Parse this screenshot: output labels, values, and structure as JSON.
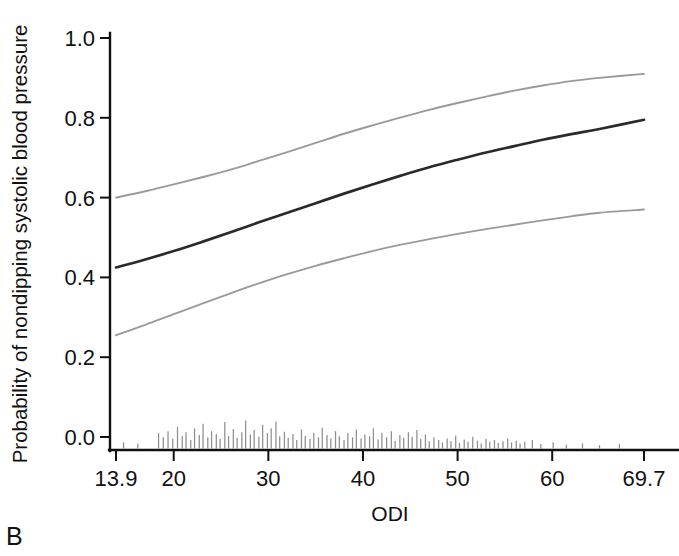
{
  "panel": {
    "letter": "B"
  },
  "chart_data": {
    "type": "line",
    "title": "",
    "subtitle": "",
    "xlabel": "ODI",
    "ylabel": "Probability of nondipping systolic blood pressure",
    "xlim": [
      13.9,
      69.7
    ],
    "ylim": [
      0.0,
      1.0
    ],
    "grid": false,
    "legend": "none",
    "xticks": [
      13.9,
      20,
      30,
      40,
      50,
      60,
      69.7
    ],
    "xtick_labels": [
      "13.9",
      "20",
      "30",
      "40",
      "50",
      "60",
      "69.7"
    ],
    "yticks": [
      0.0,
      0.2,
      0.4,
      0.6,
      0.8,
      1.0
    ],
    "ytick_labels": [
      "0.0",
      "0.2",
      "0.4",
      "0.6",
      "0.8",
      "1.0"
    ],
    "x": [
      13.9,
      17,
      20,
      23,
      26,
      29,
      32,
      35,
      38,
      41,
      44,
      47,
      50,
      53,
      56,
      59,
      62,
      65,
      69.7
    ],
    "series": [
      {
        "name": "upper-95-confidence-limit",
        "color": "#9a9a9a",
        "style": "solid",
        "values": [
          0.6,
          0.616,
          0.633,
          0.651,
          0.67,
          0.692,
          0.714,
          0.737,
          0.76,
          0.781,
          0.801,
          0.82,
          0.837,
          0.853,
          0.868,
          0.881,
          0.892,
          0.9,
          0.91
        ]
      },
      {
        "name": "predicted-probability",
        "color": "#2a2a2a",
        "style": "solid",
        "values": [
          0.425,
          0.445,
          0.466,
          0.489,
          0.513,
          0.538,
          0.562,
          0.586,
          0.61,
          0.633,
          0.655,
          0.676,
          0.695,
          0.713,
          0.729,
          0.745,
          0.759,
          0.772,
          0.795
        ]
      },
      {
        "name": "lower-95-confidence-limit",
        "color": "#9a9a9a",
        "style": "solid",
        "values": [
          0.255,
          0.281,
          0.308,
          0.334,
          0.36,
          0.385,
          0.408,
          0.429,
          0.448,
          0.466,
          0.482,
          0.496,
          0.509,
          0.521,
          0.532,
          0.543,
          0.553,
          0.562,
          0.57
        ]
      }
    ],
    "rug": {
      "name": "observation-density-rug",
      "color": "#8e8e8e",
      "description": "vertical tick marks above x-axis indicating ODI observation density",
      "marks": [
        [
          14.7,
          0.22
        ],
        [
          16.2,
          0.18
        ],
        [
          18.4,
          0.55
        ],
        [
          18.9,
          0.4
        ],
        [
          19.4,
          0.62
        ],
        [
          19.9,
          0.35
        ],
        [
          20.4,
          0.78
        ],
        [
          20.9,
          0.45
        ],
        [
          21.3,
          0.58
        ],
        [
          21.8,
          0.3
        ],
        [
          22.2,
          0.72
        ],
        [
          22.7,
          0.48
        ],
        [
          23.1,
          0.88
        ],
        [
          23.6,
          0.4
        ],
        [
          24.0,
          0.62
        ],
        [
          24.5,
          0.52
        ],
        [
          24.9,
          0.35
        ],
        [
          25.4,
          0.95
        ],
        [
          25.8,
          0.45
        ],
        [
          26.3,
          0.7
        ],
        [
          26.7,
          0.38
        ],
        [
          27.2,
          0.58
        ],
        [
          27.6,
          1.0
        ],
        [
          28.1,
          0.5
        ],
        [
          28.5,
          0.66
        ],
        [
          29.0,
          0.42
        ],
        [
          29.4,
          0.85
        ],
        [
          29.9,
          0.55
        ],
        [
          30.3,
          0.72
        ],
        [
          30.8,
          0.96
        ],
        [
          31.2,
          0.44
        ],
        [
          31.7,
          0.6
        ],
        [
          32.1,
          0.38
        ],
        [
          32.6,
          0.52
        ],
        [
          33.0,
          0.3
        ],
        [
          33.5,
          0.68
        ],
        [
          33.9,
          0.45
        ],
        [
          34.4,
          0.34
        ],
        [
          34.8,
          0.56
        ],
        [
          35.3,
          0.4
        ],
        [
          35.7,
          0.74
        ],
        [
          36.2,
          0.48
        ],
        [
          36.6,
          0.36
        ],
        [
          37.1,
          0.62
        ],
        [
          37.5,
          0.44
        ],
        [
          38.0,
          0.3
        ],
        [
          38.4,
          0.55
        ],
        [
          38.9,
          0.4
        ],
        [
          39.3,
          0.68
        ],
        [
          39.8,
          0.36
        ],
        [
          40.2,
          0.5
        ],
        [
          40.7,
          0.44
        ],
        [
          41.1,
          0.72
        ],
        [
          41.6,
          0.32
        ],
        [
          42.0,
          0.56
        ],
        [
          42.5,
          0.4
        ],
        [
          43.0,
          0.62
        ],
        [
          43.4,
          0.28
        ],
        [
          43.9,
          0.48
        ],
        [
          44.3,
          0.38
        ],
        [
          44.8,
          0.58
        ],
        [
          45.2,
          0.42
        ],
        [
          45.7,
          0.66
        ],
        [
          46.1,
          0.34
        ],
        [
          46.6,
          0.5
        ],
        [
          47.0,
          0.26
        ],
        [
          47.5,
          0.4
        ],
        [
          48.0,
          0.3
        ],
        [
          48.4,
          0.22
        ],
        [
          48.9,
          0.36
        ],
        [
          49.3,
          0.26
        ],
        [
          49.8,
          0.46
        ],
        [
          50.2,
          0.2
        ],
        [
          50.7,
          0.32
        ],
        [
          51.1,
          0.24
        ],
        [
          51.6,
          0.42
        ],
        [
          52.1,
          0.28
        ],
        [
          52.5,
          0.18
        ],
        [
          53.0,
          0.34
        ],
        [
          53.4,
          0.24
        ],
        [
          53.9,
          0.3
        ],
        [
          54.3,
          0.2
        ],
        [
          54.8,
          0.26
        ],
        [
          55.3,
          0.36
        ],
        [
          55.7,
          0.22
        ],
        [
          56.2,
          0.28
        ],
        [
          56.6,
          0.18
        ],
        [
          57.1,
          0.24
        ],
        [
          57.9,
          0.3
        ],
        [
          58.8,
          0.16
        ],
        [
          60.1,
          0.22
        ],
        [
          61.5,
          0.14
        ],
        [
          63.2,
          0.18
        ],
        [
          65.0,
          0.12
        ],
        [
          67.1,
          0.16
        ]
      ]
    }
  }
}
